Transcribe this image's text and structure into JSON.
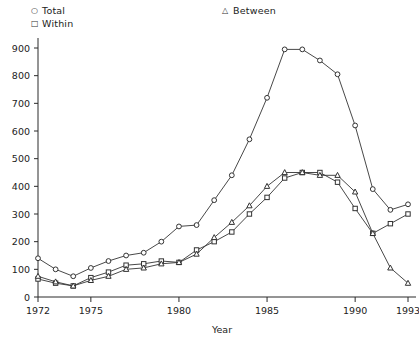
{
  "legend": {
    "entries": [
      {
        "label": "Total",
        "marker": "circle-marker-icon",
        "glyph": "○"
      },
      {
        "label": "Within",
        "marker": "square-marker-icon",
        "glyph": "□"
      },
      {
        "label": "Between",
        "marker": "triangle-marker-icon",
        "glyph": "△"
      }
    ]
  },
  "chart_data": {
    "type": "line",
    "title": "",
    "xlabel": "Year",
    "ylabel": "",
    "xlim": [
      1972,
      1993
    ],
    "ylim": [
      0,
      900
    ],
    "grid": false,
    "legend_position": "top",
    "xticks": [
      1972,
      1975,
      1980,
      1985,
      1990,
      1993
    ],
    "xtick_labels": [
      "1972",
      "1975",
      "1980",
      "1985",
      "1990",
      "1993"
    ],
    "yticks": [
      0,
      100,
      200,
      300,
      400,
      500,
      600,
      700,
      800,
      900
    ],
    "ytick_labels": [
      "0",
      "100",
      "200",
      "300",
      "400",
      "500",
      "600",
      "700",
      "800",
      "900"
    ],
    "x": [
      1972,
      1973,
      1974,
      1975,
      1976,
      1977,
      1978,
      1979,
      1980,
      1981,
      1982,
      1983,
      1984,
      1985,
      1986,
      1987,
      1988,
      1989,
      1990,
      1991,
      1992,
      1993
    ],
    "series": [
      {
        "name": "Total",
        "marker": "circle",
        "values": [
          140,
          100,
          75,
          105,
          130,
          150,
          160,
          200,
          255,
          260,
          350,
          440,
          570,
          720,
          895,
          895,
          855,
          805,
          620,
          390,
          315,
          335
        ]
      },
      {
        "name": "Within",
        "marker": "square",
        "values": [
          65,
          50,
          40,
          70,
          90,
          115,
          120,
          130,
          125,
          170,
          200,
          235,
          300,
          360,
          430,
          450,
          450,
          415,
          320,
          230,
          265,
          300
        ]
      },
      {
        "name": "Between",
        "marker": "triangle",
        "values": [
          75,
          55,
          40,
          60,
          75,
          100,
          105,
          120,
          125,
          155,
          215,
          270,
          330,
          400,
          450,
          450,
          440,
          440,
          380,
          230,
          105,
          50
        ]
      }
    ]
  }
}
